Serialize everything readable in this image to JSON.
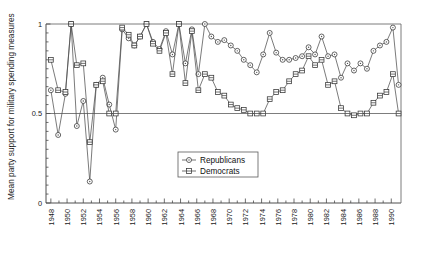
{
  "chart_data": {
    "type": "line",
    "title": "",
    "xlabel": "",
    "ylabel": "Mean party support for military spending measures",
    "xlim": [
      1947.4,
      1991.2
    ],
    "ylim": [
      0,
      1
    ],
    "yticks": [
      0,
      0.5,
      1
    ],
    "ytick_labels": [
      "0",
      "0.5",
      "1"
    ],
    "xticks": [
      1948,
      1950,
      1952,
      1954,
      1956,
      1958,
      1960,
      1962,
      1964,
      1966,
      1968,
      1970,
      1972,
      1974,
      1976,
      1978,
      1980,
      1982,
      1984,
      1986,
      1988,
      1990
    ],
    "xtick_labels": [
      "1948",
      "1950",
      "1952",
      "1954",
      "1956",
      "1958",
      "1960",
      "1962",
      "1964",
      "1966",
      "1968",
      "1970",
      "1972",
      "1974",
      "1976",
      "1978",
      "1980",
      "1982",
      "1984",
      "1986",
      "1988",
      "1990"
    ],
    "grid": false,
    "gridlines_y": [
      0.5,
      1.0
    ],
    "legend_position": "center",
    "legend_entries": [
      "Republicans",
      "Democrats"
    ],
    "series": [
      {
        "name": "Republicans",
        "marker": "circle",
        "x": [
          1948.0,
          1948.9,
          1949.8,
          1950.5,
          1951.2,
          1952.0,
          1952.8,
          1953.6,
          1954.4,
          1955.2,
          1956.0,
          1956.8,
          1957.6,
          1958.3,
          1959.0,
          1959.8,
          1960.6,
          1961.4,
          1962.2,
          1963.0,
          1963.8,
          1964.6,
          1965.4,
          1966.2,
          1967.0,
          1967.8,
          1968.6,
          1969.4,
          1970.2,
          1971.0,
          1971.8,
          1972.6,
          1973.4,
          1974.2,
          1975.0,
          1975.8,
          1976.6,
          1977.4,
          1978.2,
          1979.0,
          1979.8,
          1980.6,
          1981.4,
          1982.2,
          1983.0,
          1983.8,
          1984.6,
          1985.4,
          1986.2,
          1987.0,
          1987.8,
          1988.6,
          1989.4,
          1990.2,
          1990.9
        ],
        "y": [
          0.63,
          0.38,
          0.61,
          1.0,
          0.43,
          0.57,
          0.12,
          0.66,
          0.7,
          0.55,
          0.41,
          0.97,
          0.92,
          0.88,
          0.93,
          1.0,
          0.9,
          0.86,
          0.96,
          0.83,
          1.0,
          0.78,
          0.97,
          0.72,
          1.0,
          0.93,
          0.9,
          0.91,
          0.88,
          0.85,
          0.8,
          0.77,
          0.73,
          0.83,
          0.95,
          0.84,
          0.8,
          0.8,
          0.81,
          0.82,
          0.87,
          0.83,
          0.93,
          0.82,
          0.83,
          0.7,
          0.78,
          0.74,
          0.78,
          0.75,
          0.85,
          0.88,
          0.9,
          0.98,
          0.66
        ]
      },
      {
        "name": "Democrats",
        "marker": "square",
        "x": [
          1948.0,
          1948.9,
          1949.8,
          1950.5,
          1951.2,
          1952.0,
          1952.8,
          1953.6,
          1954.4,
          1955.2,
          1956.0,
          1956.8,
          1957.6,
          1958.3,
          1959.0,
          1959.8,
          1960.6,
          1961.4,
          1962.2,
          1963.0,
          1963.8,
          1964.6,
          1965.4,
          1966.2,
          1967.0,
          1967.8,
          1968.6,
          1969.4,
          1970.2,
          1971.0,
          1971.8,
          1972.6,
          1973.4,
          1974.2,
          1975.0,
          1975.8,
          1976.6,
          1977.4,
          1978.2,
          1979.0,
          1979.8,
          1980.6,
          1981.4,
          1982.2,
          1983.0,
          1983.8,
          1984.6,
          1985.4,
          1986.2,
          1987.0,
          1987.8,
          1988.6,
          1989.4,
          1990.2,
          1990.9
        ],
        "y": [
          0.8,
          0.63,
          0.62,
          1.0,
          0.77,
          0.78,
          0.34,
          0.66,
          0.68,
          0.5,
          0.5,
          0.98,
          0.94,
          0.88,
          0.93,
          1.0,
          0.89,
          0.85,
          0.95,
          0.72,
          1.0,
          0.67,
          0.96,
          0.63,
          0.72,
          0.7,
          0.62,
          0.6,
          0.55,
          0.53,
          0.52,
          0.5,
          0.5,
          0.5,
          0.58,
          0.62,
          0.63,
          0.68,
          0.72,
          0.74,
          0.82,
          0.77,
          0.8,
          0.66,
          0.68,
          0.53,
          0.5,
          0.49,
          0.5,
          0.5,
          0.56,
          0.6,
          0.62,
          0.72,
          0.5
        ]
      }
    ]
  },
  "legend": {
    "republicans": "Republicans",
    "democrats": "Democrats"
  },
  "axis": {
    "y_label": "Mean party support for military spending measures"
  },
  "colors": {
    "line": "#4f4f4f",
    "marker_stroke": "#333333",
    "marker_fill": "#ffffff",
    "frame": "#6e6e6e",
    "text": "#1a1a1a"
  }
}
